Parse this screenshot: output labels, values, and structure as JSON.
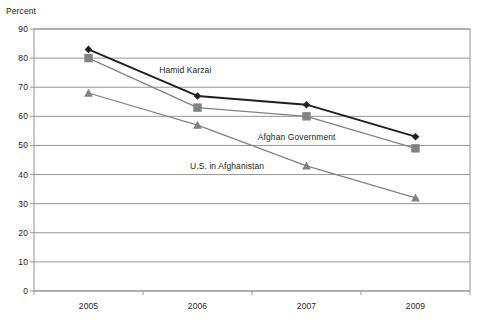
{
  "chart_data": {
    "type": "line",
    "title": "",
    "subtitle": "",
    "xlabel": "",
    "ylabel": "Percent",
    "categories": [
      "2005",
      "2006",
      "2007",
      "2009"
    ],
    "ylim": [
      0,
      90
    ],
    "yticks": [
      0,
      10,
      20,
      30,
      40,
      50,
      60,
      70,
      80,
      90
    ],
    "ytick_labels": [
      "0",
      "10",
      "20",
      "30",
      "40",
      "50",
      "60",
      "70",
      "80",
      "90"
    ],
    "grid": true,
    "grid_axis": "y",
    "legend_position": "inline-annotations",
    "series": [
      {
        "name": "Hamid Karzai",
        "values": [
          83,
          67,
          64,
          53
        ],
        "color": "#231f20",
        "marker": "diamond",
        "label_x_pct": 33.1,
        "label_y_pct": 19.8
      },
      {
        "name": "Afghan Government",
        "values": [
          80,
          63,
          60,
          49
        ],
        "color": "#808285",
        "marker": "square",
        "label_x_pct": 53.6,
        "label_y_pct": 40.2
      },
      {
        "name": "U.S. in Afghanistan",
        "values": [
          68,
          57,
          43,
          32
        ],
        "color": "#808285",
        "marker": "triangle",
        "label_x_pct": 39.5,
        "label_y_pct": 49.1
      }
    ]
  }
}
